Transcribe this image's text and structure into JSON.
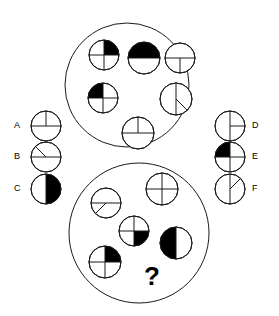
{
  "puzzle": {
    "type": "visual-analogy-circle-fractions",
    "question_mark": "?",
    "canvas": {
      "width": 279,
      "height": 316
    },
    "stroke_color": "#1a1a1a",
    "fill_color": "#000000",
    "background_color": "#ffffff"
  },
  "groups": [
    {
      "name": "top-group",
      "center": {
        "x": 127,
        "y": 85
      },
      "radius": 62,
      "figures": [
        {
          "id": "top-fig-1",
          "description": "circle with cross, upper-right quadrant filled",
          "center": {
            "x": 104,
            "y": 55
          },
          "radius": 15,
          "lines": [
            "horizontal-diameter",
            "vertical-diameter"
          ],
          "filled_sectors": [
            "upper-right"
          ]
        },
        {
          "id": "top-fig-2",
          "description": "circle with horizontal diameter, lower half filled",
          "center": {
            "x": 144,
            "y": 58
          },
          "radius": 16,
          "lines": [
            "horizontal-diameter"
          ],
          "filled_sectors": [
            "lower-half"
          ]
        },
        {
          "id": "top-fig-3",
          "description": "circle with horizontal diameter and vertical line in lower half, unfilled",
          "center": {
            "x": 180,
            "y": 58
          },
          "radius": 15,
          "lines": [
            "horizontal-diameter",
            "vertical-lower-radius"
          ],
          "filled_sectors": []
        },
        {
          "id": "top-fig-4",
          "description": "circle with cross, upper-left quadrant filled",
          "center": {
            "x": 103,
            "y": 98
          },
          "radius": 15,
          "lines": [
            "horizontal-diameter",
            "vertical-diameter"
          ],
          "filled_sectors": [
            "upper-left"
          ]
        },
        {
          "id": "top-fig-5",
          "description": "circle with vertical diameter and diagonal line in lower-right, unfilled",
          "center": {
            "x": 176,
            "y": 99
          },
          "radius": 16,
          "lines": [
            "vertical-diameter",
            "diagonal-lower-right-radius"
          ],
          "filled_sectors": []
        },
        {
          "id": "top-fig-6",
          "description": "circle with horizontal diameter and vertical line in upper half, unfilled",
          "center": {
            "x": 138,
            "y": 133
          },
          "radius": 16,
          "lines": [
            "horizontal-diameter",
            "vertical-upper-radius"
          ],
          "filled_sectors": []
        }
      ]
    },
    {
      "name": "bottom-group",
      "center": {
        "x": 139,
        "y": 233
      },
      "radius": 70,
      "figures": [
        {
          "id": "bottom-fig-1",
          "description": "circle with horizontal diameter and diagonal line in lower-left, unfilled",
          "center": {
            "x": 106,
            "y": 203
          },
          "radius": 15,
          "lines": [
            "horizontal-diameter",
            "diagonal-lower-left-radius"
          ],
          "filled_sectors": []
        },
        {
          "id": "bottom-fig-2",
          "description": "circle with cross, unfilled",
          "center": {
            "x": 162,
            "y": 189
          },
          "radius": 16,
          "lines": [
            "horizontal-diameter",
            "vertical-diameter"
          ],
          "filled_sectors": []
        },
        {
          "id": "bottom-fig-3",
          "description": "circle with cross, lower-right quadrant filled",
          "center": {
            "x": 134,
            "y": 231
          },
          "radius": 15,
          "lines": [
            "horizontal-diameter",
            "vertical-diameter"
          ],
          "filled_sectors": [
            "lower-right"
          ]
        },
        {
          "id": "bottom-fig-4",
          "description": "circle with vertical diameter, left half filled",
          "center": {
            "x": 176,
            "y": 243
          },
          "radius": 16,
          "lines": [
            "vertical-diameter"
          ],
          "filled_sectors": [
            "left-half"
          ]
        },
        {
          "id": "bottom-fig-5",
          "description": "circle with cross, upper-right quadrant filled",
          "center": {
            "x": 105,
            "y": 262
          },
          "radius": 16,
          "lines": [
            "horizontal-diameter",
            "vertical-diameter"
          ],
          "filled_sectors": [
            "upper-right"
          ]
        }
      ],
      "question_slot": {
        "x": 152,
        "y": 278
      }
    }
  ],
  "options": {
    "left": [
      {
        "id": "option-a",
        "label": "A",
        "label_pos": {
          "x": 14,
          "y": 126
        },
        "center": {
          "x": 46,
          "y": 126
        },
        "radius": 15,
        "description": "circle with horizontal diameter and vertical line in upper half, unfilled",
        "lines": [
          "horizontal-diameter",
          "vertical-upper-radius"
        ],
        "filled_sectors": []
      },
      {
        "id": "option-b",
        "label": "B",
        "label_pos": {
          "x": 14,
          "y": 157
        },
        "center": {
          "x": 46,
          "y": 157
        },
        "radius": 15,
        "description": "circle with horizontal diameter and diagonal line in upper-left, unfilled",
        "lines": [
          "horizontal-diameter",
          "diagonal-upper-left-radius"
        ],
        "filled_sectors": []
      },
      {
        "id": "option-c",
        "label": "C",
        "label_pos": {
          "x": 14,
          "y": 189
        },
        "center": {
          "x": 46,
          "y": 189
        },
        "radius": 15,
        "description": "circle with vertical diameter, right half filled",
        "lines": [
          "vertical-diameter"
        ],
        "filled_sectors": [
          "right-half"
        ]
      }
    ],
    "right": [
      {
        "id": "option-d",
        "label": "D",
        "label_pos": {
          "x": 252,
          "y": 126
        },
        "center": {
          "x": 230,
          "y": 126
        },
        "radius": 15,
        "description": "circle with vertical diameter and horizontal line in right half, unfilled",
        "lines": [
          "vertical-diameter",
          "horizontal-right-radius"
        ],
        "filled_sectors": []
      },
      {
        "id": "option-e",
        "label": "E",
        "label_pos": {
          "x": 252,
          "y": 157
        },
        "center": {
          "x": 230,
          "y": 157
        },
        "radius": 15,
        "description": "circle with cross, upper-left quadrant filled",
        "lines": [
          "horizontal-diameter",
          "vertical-diameter"
        ],
        "filled_sectors": [
          "upper-left"
        ]
      },
      {
        "id": "option-f",
        "label": "F",
        "label_pos": {
          "x": 252,
          "y": 189
        },
        "center": {
          "x": 230,
          "y": 189
        },
        "radius": 15,
        "description": "circle with vertical diameter and diagonal line in upper-right, unfilled",
        "lines": [
          "vertical-diameter",
          "diagonal-upper-right-radius"
        ],
        "filled_sectors": []
      }
    ]
  }
}
